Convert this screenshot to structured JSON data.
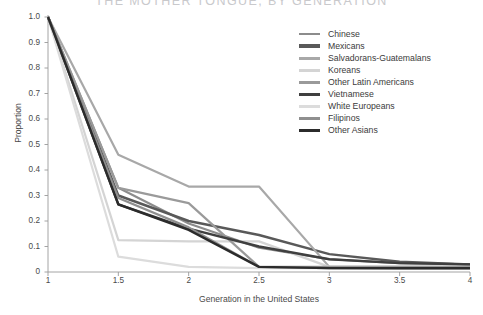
{
  "chart_data": {
    "type": "line",
    "title": "THE MOTHER TONGUE, BY GENERATION",
    "xlabel": "Generation in the United States",
    "ylabel": "Proportion",
    "x": [
      1,
      1.5,
      2,
      2.5,
      3,
      3.5,
      4
    ],
    "xticklabels": [
      "1",
      "1.5",
      "2",
      "2.5",
      "3",
      "3.5",
      "4"
    ],
    "yticklabels": [
      "0",
      "0.1",
      "0.2",
      "0.3",
      "0.4",
      "0.5",
      "0.6",
      "0.7",
      "0.8",
      "0.9",
      "1.0"
    ],
    "xlim": [
      1,
      4
    ],
    "ylim": [
      0,
      1.0
    ],
    "grid": false,
    "legend_position": "top-right",
    "series": [
      {
        "name": "Chinese",
        "color": "#8c8c8c",
        "width": 2.2,
        "values": [
          1.0,
          0.33,
          0.19,
          0.095,
          0.05,
          0.035,
          0.03
        ]
      },
      {
        "name": "Mexicans",
        "color": "#595959",
        "width": 2.4,
        "values": [
          1.0,
          0.3,
          0.2,
          0.145,
          0.07,
          0.04,
          0.03
        ]
      },
      {
        "name": "Salvadorans-Guatemalans",
        "color": "#a8a8a8",
        "width": 2.2,
        "values": [
          1.0,
          0.46,
          0.335,
          0.335,
          0.02,
          0.02,
          0.02
        ]
      },
      {
        "name": "Koreans",
        "color": "#d4d4d4",
        "width": 2.2,
        "values": [
          1.0,
          0.125,
          0.12,
          0.12,
          0.02,
          0.02,
          0.02
        ]
      },
      {
        "name": "Other Latin Americans",
        "color": "#9a9a9a",
        "width": 2.2,
        "values": [
          1.0,
          0.33,
          0.27,
          0.02,
          0.02,
          0.02,
          0.02
        ]
      },
      {
        "name": "Vietnamese",
        "color": "#3f3f3f",
        "width": 2.4,
        "values": [
          1.0,
          0.265,
          0.17,
          0.1,
          0.05,
          0.035,
          0.03
        ]
      },
      {
        "name": "White Europeans",
        "color": "#dcdcdc",
        "width": 2.2,
        "values": [
          1.0,
          0.06,
          0.02,
          0.015,
          0.015,
          0.015,
          0.015
        ]
      },
      {
        "name": "Filipinos",
        "color": "#8f8f8f",
        "width": 2.2,
        "values": [
          1.0,
          0.29,
          0.175,
          0.02,
          0.015,
          0.015,
          0.015
        ]
      },
      {
        "name": "Other Asians",
        "color": "#2b2b2b",
        "width": 2.4,
        "values": [
          1.0,
          0.265,
          0.165,
          0.02,
          0.015,
          0.015,
          0.015
        ]
      }
    ]
  }
}
